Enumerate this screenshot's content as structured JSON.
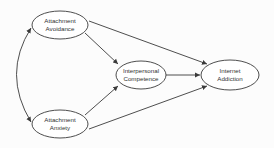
{
  "diagram": {
    "type": "path-model",
    "nodes": [
      {
        "id": "avoidance",
        "line1": "Attachment",
        "line2": "Avoidance"
      },
      {
        "id": "anxiety",
        "line1": "Attachment",
        "line2": "Anxiety"
      },
      {
        "id": "competence",
        "line1": "Interpersonal",
        "line2": "Competence"
      },
      {
        "id": "addiction",
        "line1": "Internet",
        "line2": "Addiction"
      }
    ],
    "edges": [
      {
        "from": "avoidance",
        "to": "anxiety",
        "kind": "bidirectional-curved"
      },
      {
        "from": "avoidance",
        "to": "competence",
        "kind": "directed"
      },
      {
        "from": "avoidance",
        "to": "addiction",
        "kind": "directed"
      },
      {
        "from": "anxiety",
        "to": "competence",
        "kind": "directed"
      },
      {
        "from": "anxiety",
        "to": "addiction",
        "kind": "directed"
      },
      {
        "from": "competence",
        "to": "addiction",
        "kind": "directed"
      }
    ],
    "colors": {
      "stroke": "#3a3a3a",
      "fill": "#ffffff",
      "text": "#333333"
    }
  }
}
